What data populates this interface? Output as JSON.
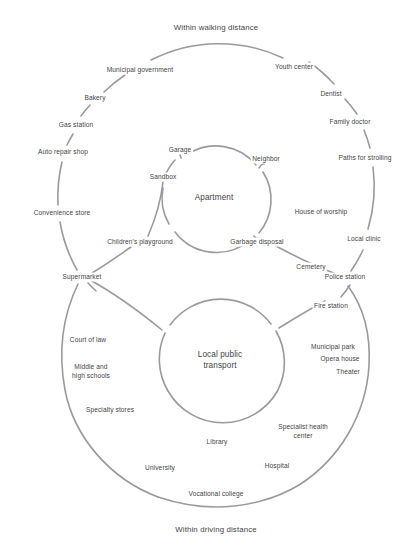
{
  "diagram": {
    "type": "concentric-radial-map",
    "stroke_color": "#9a9a9e",
    "text_color": "#3f3f46",
    "background_color": "#ffffff"
  },
  "captions": {
    "top": "Within walking distance",
    "bottom": "Within driving distance"
  },
  "cores": [
    {
      "id": "apartment",
      "label": "Apartment",
      "cx": 214,
      "cy": 198,
      "r": 52
    },
    {
      "id": "transport",
      "label": "Local public\ntransport",
      "cx": 220,
      "cy": 360,
      "r": 63
    }
  ],
  "walking_ring": {
    "caption": "Within walking distance",
    "cx": 216,
    "cy": 196,
    "r": 150,
    "nodes": [
      {
        "label": "Municipal government",
        "x": 140,
        "y": 70
      },
      {
        "label": "Youth center",
        "x": 294,
        "y": 67
      },
      {
        "label": "Bakery",
        "x": 95,
        "y": 98
      },
      {
        "label": "Dentist",
        "x": 331,
        "y": 94
      },
      {
        "label": "Gas station",
        "x": 76,
        "y": 125
      },
      {
        "label": "Family doctor",
        "x": 350,
        "y": 122
      },
      {
        "label": "Auto repair shop",
        "x": 63,
        "y": 152
      },
      {
        "label": "Paths for strolling",
        "x": 365,
        "y": 158
      },
      {
        "label": "Convenience store",
        "x": 62,
        "y": 213
      },
      {
        "label": "House of worship",
        "x": 321,
        "y": 212
      },
      {
        "label": "Local clinic",
        "x": 364,
        "y": 239
      },
      {
        "label": "Supermarket",
        "x": 82,
        "y": 277
      },
      {
        "label": "Cemetery",
        "x": 311,
        "y": 267
      },
      {
        "label": "Police station",
        "x": 345,
        "y": 277
      }
    ]
  },
  "apartment_spokes": [
    {
      "label": "Garage",
      "x": 180,
      "y": 150
    },
    {
      "label": "Neighbor",
      "x": 266,
      "y": 159
    },
    {
      "label": "Sandbox",
      "x": 163,
      "y": 177
    },
    {
      "label": "Children's playground",
      "x": 140,
      "y": 242
    },
    {
      "label": "Garbage disposal",
      "x": 257,
      "y": 242
    }
  ],
  "driving_ring": {
    "caption": "Within driving distance",
    "cx": 219,
    "cy": 348,
    "r": 161,
    "nodes": [
      {
        "label": "Fire station",
        "x": 331,
        "y": 306
      },
      {
        "label": "Court of law",
        "x": 88,
        "y": 340
      },
      {
        "label": "Municipal park",
        "x": 333,
        "y": 347
      },
      {
        "label": "Opera house",
        "x": 340,
        "y": 359
      },
      {
        "label": "Theater",
        "x": 348,
        "y": 372
      },
      {
        "label": "Middle and\nhigh schools",
        "x": 91,
        "y": 372
      },
      {
        "label": "Specialty stores",
        "x": 110,
        "y": 410
      },
      {
        "label": "Specialist health\ncenter",
        "x": 303,
        "y": 432
      },
      {
        "label": "Library",
        "x": 217,
        "y": 442
      },
      {
        "label": "Hospital",
        "x": 277,
        "y": 466
      },
      {
        "label": "University",
        "x": 160,
        "y": 468
      },
      {
        "label": "Vocational college",
        "x": 216,
        "y": 494
      }
    ]
  }
}
